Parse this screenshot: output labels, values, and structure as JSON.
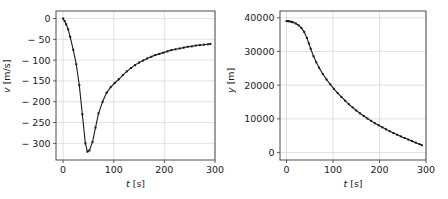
{
  "figure": {
    "background_color": "#ffffff",
    "line_color": "#1a1a1a",
    "grid_color": "#d4d4d4",
    "spine_color": "#4d4d4d"
  },
  "chart_data": [
    {
      "type": "line",
      "title": "",
      "xlabel": "t [s]",
      "ylabel": "v [m/s]",
      "xlabel_var": "t",
      "xlabel_unit": "[s]",
      "ylabel_var": "v",
      "ylabel_unit": "[m/s]",
      "xlim": [
        -14,
        300
      ],
      "ylim": [
        -340,
        18
      ],
      "xticks": [
        0,
        100,
        200,
        300
      ],
      "xticklabels": [
        "0",
        "100",
        "200",
        "300"
      ],
      "yticks": [
        0,
        -50,
        -100,
        -150,
        -200,
        -250,
        -300
      ],
      "yticklabels": [
        "0",
        "− 50",
        "− 100",
        "− 150",
        "− 200",
        "− 250",
        "− 300"
      ],
      "grid": true,
      "markers": "square",
      "x": [
        0,
        3,
        6,
        10,
        14,
        20,
        26,
        32,
        38,
        44,
        48,
        52,
        58,
        64,
        70,
        78,
        86,
        94,
        102,
        110,
        118,
        126,
        134,
        142,
        150,
        158,
        166,
        174,
        182,
        190,
        198,
        206,
        214,
        222,
        230,
        238,
        246,
        254,
        262,
        270,
        278,
        286,
        291
      ],
      "y": [
        0,
        -6,
        -14,
        -26,
        -44,
        -75,
        -110,
        -160,
        -230,
        -300,
        -320,
        -317,
        -297,
        -262,
        -228,
        -200,
        -178,
        -165,
        -155,
        -146,
        -136,
        -127,
        -119,
        -112,
        -106,
        -101,
        -96,
        -92,
        -88,
        -85,
        -82,
        -79,
        -76,
        -74,
        -72,
        -70,
        -68,
        -67,
        -65,
        -64,
        -63,
        -62,
        -61
      ]
    },
    {
      "type": "line",
      "title": "",
      "xlabel": "t [s]",
      "ylabel": "y [m]",
      "xlabel_var": "t",
      "xlabel_unit": "[s]",
      "ylabel_var": "y",
      "ylabel_unit": "[m]",
      "xlim": [
        -14,
        300
      ],
      "ylim": [
        -2200,
        42000
      ],
      "xticks": [
        0,
        100,
        200,
        300
      ],
      "xticklabels": [
        "0",
        "100",
        "200",
        "300"
      ],
      "yticks": [
        0,
        10000,
        20000,
        30000,
        40000
      ],
      "yticklabels": [
        "0",
        "10000",
        "20000",
        "30000",
        "40000"
      ],
      "grid": true,
      "markers": "square",
      "x": [
        0,
        3,
        6,
        10,
        14,
        20,
        26,
        32,
        38,
        44,
        48,
        52,
        58,
        64,
        70,
        78,
        86,
        94,
        102,
        110,
        118,
        126,
        134,
        142,
        150,
        158,
        166,
        174,
        182,
        190,
        198,
        206,
        214,
        222,
        230,
        238,
        246,
        254,
        262,
        270,
        278,
        286,
        291
      ],
      "y": [
        39000,
        38980,
        38930,
        38820,
        38650,
        38300,
        37750,
        37000,
        35800,
        34000,
        32400,
        30800,
        28600,
        26800,
        25200,
        23300,
        21700,
        20250,
        18900,
        17650,
        16500,
        15400,
        14350,
        13400,
        12500,
        11650,
        10850,
        10100,
        9400,
        8720,
        8100,
        7500,
        6900,
        6350,
        5800,
        5300,
        4800,
        4320,
        3850,
        3400,
        2950,
        2500,
        2200
      ]
    }
  ]
}
